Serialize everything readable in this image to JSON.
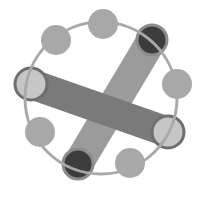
{
  "diagram": {
    "title": "",
    "colors": {
      "background": "#ffffff",
      "ring": "#a9a9a9",
      "node": "#a8a8a8",
      "dark_node_fill": "#3c3c3c",
      "dark_node_outline": "#8c8c8c",
      "light_node_fill": "#c6c6c6",
      "light_node_outline": "#6e6e6e",
      "bar_back": "#9b9b9b",
      "bar_front": "#7a7a7a"
    },
    "ring": {
      "cx": 101,
      "cy": 98,
      "r": 76,
      "stroke_width": 3
    },
    "nodes": [
      {
        "id": "top",
        "cx": 103,
        "cy": 24,
        "r": 15,
        "kind": "plain"
      },
      {
        "id": "top-left",
        "cx": 56,
        "cy": 40,
        "r": 15,
        "kind": "plain"
      },
      {
        "id": "right",
        "cx": 177,
        "cy": 84,
        "r": 15,
        "kind": "plain"
      },
      {
        "id": "lower-left",
        "cx": 40,
        "cy": 132,
        "r": 15,
        "kind": "plain"
      },
      {
        "id": "bottom-right",
        "cx": 130,
        "cy": 163,
        "r": 15,
        "kind": "plain"
      }
    ],
    "bars": [
      {
        "id": "diagonal-bar",
        "x1": 152,
        "y1": 40,
        "x2": 78,
        "y2": 164,
        "width": 30
      },
      {
        "id": "horizontal-bar",
        "x1": 31,
        "y1": 84,
        "x2": 168,
        "y2": 132,
        "width": 30
      }
    ],
    "endpoints": [
      {
        "id": "dark-top-right",
        "cx": 152,
        "cy": 40,
        "r": 15,
        "kind": "dark"
      },
      {
        "id": "dark-bottom",
        "cx": 78,
        "cy": 164,
        "r": 15,
        "kind": "dark"
      },
      {
        "id": "light-left",
        "cx": 31,
        "cy": 84,
        "r": 16,
        "kind": "light"
      },
      {
        "id": "light-right",
        "cx": 168,
        "cy": 132,
        "r": 16,
        "kind": "light"
      }
    ]
  }
}
